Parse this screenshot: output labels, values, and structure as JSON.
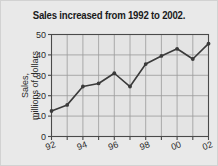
{
  "figure": {
    "background_color": "#e9e9e9",
    "plot_background_color": "#e4e4e4",
    "grid_color": "#9a9a9a",
    "line_color": "#3a3a3a",
    "axis_color": "#4a4a4a"
  },
  "chart_data": {
    "type": "line",
    "title": "Sales increased from 1992 to 2002.",
    "xlabel": "",
    "ylabel_line1": "Sales,",
    "ylabel_line2": "millions of dollars",
    "ylabel": "Sales, millions of dollars",
    "x": [
      1992,
      1993,
      1994,
      1995,
      1996,
      1997,
      1998,
      1999,
      2000,
      2001,
      2002
    ],
    "xtick_labels": [
      "92",
      "",
      "94",
      "",
      "96",
      "",
      "98",
      "",
      "00",
      "",
      "02"
    ],
    "xtick_labels_visible": [
      "92",
      "94",
      "96",
      "98",
      "00",
      "02"
    ],
    "values": [
      12.5,
      15.5,
      24.5,
      26,
      31,
      24.5,
      35.5,
      39.5,
      43,
      38,
      45.5
    ],
    "ytick_labels": [
      "0",
      "10",
      "20",
      "30",
      "40",
      "50"
    ],
    "yticks": [
      0,
      10,
      20,
      30,
      40,
      50
    ],
    "ylim": [
      0,
      50
    ],
    "xlim": [
      1992,
      2002
    ],
    "grid": true,
    "markers": true,
    "legend": false
  }
}
